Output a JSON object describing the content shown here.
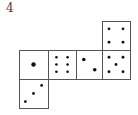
{
  "problem_number": "4",
  "net": {
    "stroke_color": "#555555",
    "dot_color": "#111111",
    "faces": [
      {
        "id": "left",
        "pips": 1,
        "x": 19,
        "y": 50,
        "w": 29,
        "h": 29
      },
      {
        "id": "mid1",
        "pips": 6,
        "x": 48,
        "y": 50,
        "w": 28,
        "h": 29
      },
      {
        "id": "mid2",
        "pips": 2,
        "x": 76,
        "y": 50,
        "w": 26,
        "h": 29
      },
      {
        "id": "right",
        "pips": 5,
        "x": 102,
        "y": 50,
        "w": 28,
        "h": 29
      },
      {
        "id": "top-right",
        "pips": 4,
        "x": 102,
        "y": 21,
        "w": 28,
        "h": 29
      },
      {
        "id": "bottom-left",
        "pips": 3,
        "x": 19,
        "y": 79,
        "w": 29,
        "h": 29
      }
    ]
  }
}
